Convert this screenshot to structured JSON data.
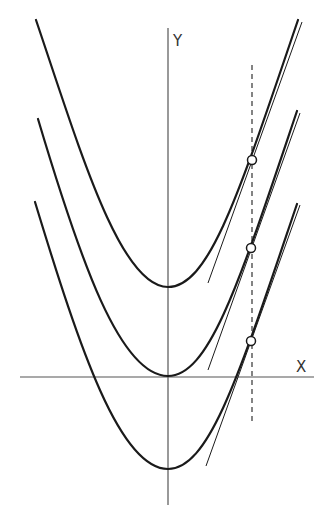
{
  "diagram": {
    "title": "",
    "axes": {
      "x_label": "X",
      "y_label": "Y"
    },
    "curves": [
      {
        "name": "parabola-top",
        "d": "M36,20 C80,150 120,287 168,287 C210,287 240,190 298,20"
      },
      {
        "name": "parabola-middle",
        "d": "M38,119 C80,260 120,376 168,376 C210,376 240,280 297,111"
      },
      {
        "name": "parabola-bottom",
        "d": "M35,202 C80,350 120,469 168,469 C210,469 240,372 297,204"
      }
    ],
    "tangents": [
      {
        "x1": 208,
        "y1": 283,
        "x2": 302,
        "y2": 22
      },
      {
        "x1": 208,
        "y1": 370,
        "x2": 300,
        "y2": 113
      },
      {
        "x1": 206,
        "y1": 466,
        "x2": 300,
        "y2": 205
      }
    ],
    "points": [
      {
        "cx": 252,
        "cy": 160
      },
      {
        "cx": 251,
        "cy": 248
      },
      {
        "cx": 251,
        "cy": 341
      }
    ],
    "vertical_line": {
      "x": 252,
      "y1": 65,
      "y2": 425,
      "style": "dashed"
    }
  }
}
